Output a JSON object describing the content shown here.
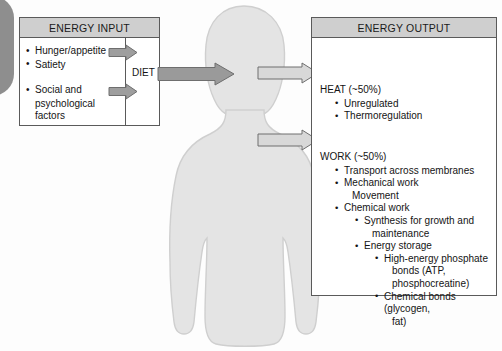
{
  "diagram": {
    "title_visible": false,
    "colors": {
      "panel_border": "#5a5a5a",
      "header_fill": "#cfcfcf",
      "silhouette_fill": "#e3e3e3",
      "silhouette_stroke": "#cdcdcd",
      "arrow_dark_fill": "#9a9a9a",
      "arrow_light_fill": "#d6d6d6",
      "arrow_stroke": "#6e6e6e",
      "text": "#141414",
      "page_tab": "#7a7a7a"
    }
  },
  "input_panel": {
    "header": "ENERGY INPUT",
    "group_1": [
      "Hunger/appetite",
      "Satiety"
    ],
    "group_2": [
      "Social and",
      "psychological",
      "factors"
    ]
  },
  "diet": {
    "label": "DIET"
  },
  "output_panel": {
    "header": "ENERGY OUTPUT",
    "heat": {
      "heading": "HEAT (~50%)",
      "items": [
        "Unregulated",
        "Thermoregulation"
      ]
    },
    "work": {
      "heading": "WORK (~50%)",
      "items": [
        {
          "level": 1,
          "text": "Transport across membranes"
        },
        {
          "level": 1,
          "text": "Mechanical work"
        },
        {
          "level": 0,
          "text": "Movement",
          "continuation": 1
        },
        {
          "level": 1,
          "text": "Chemical work"
        },
        {
          "level": 2,
          "text": "Synthesis for growth and"
        },
        {
          "level": 0,
          "text": "maintenance",
          "continuation": 2
        },
        {
          "level": 2,
          "text": "Energy storage"
        },
        {
          "level": 3,
          "text": "High-energy phosphate"
        },
        {
          "level": 0,
          "text": "bonds (ATP,",
          "continuation": 3
        },
        {
          "level": 0,
          "text": "phosphocreatine)",
          "continuation": 3
        },
        {
          "level": 3,
          "text": "Chemical bonds (glycogen,"
        },
        {
          "level": 0,
          "text": "fat)",
          "continuation": 3
        }
      ]
    }
  },
  "arrows": {
    "input_small_1": "arrow-right-icon",
    "input_small_2": "arrow-right-icon",
    "diet_main": "arrow-right-icon",
    "output_heat": "arrow-right-icon",
    "output_work": "arrow-right-icon"
  },
  "figure": {
    "label": "human-body-silhouette"
  }
}
